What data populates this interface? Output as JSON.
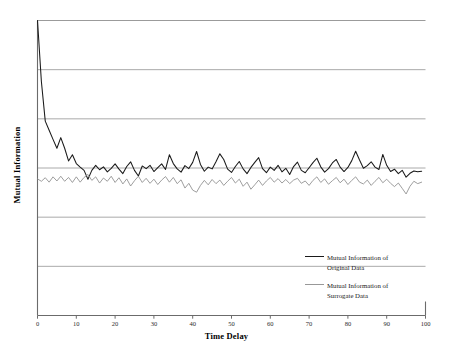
{
  "chart_data": {
    "type": "line",
    "title": "",
    "xlabel": "Time Delay",
    "ylabel": "Mutual Information",
    "xlim": [
      0,
      100
    ],
    "ylim": [
      0,
      1
    ],
    "xticks": [
      "0",
      "10",
      "20",
      "30",
      "40",
      "50",
      "60",
      "70",
      "80",
      "90",
      "100"
    ],
    "yticks": [],
    "grid": "horizontal",
    "gridline_count": 5,
    "legend_position": "inside-lower-right",
    "colors": {
      "original": "#1a1a1a",
      "surrogate": "#8c8c8c",
      "grid": "#8a8a8a",
      "axis": "#6b6b6b"
    },
    "series": [
      {
        "name": "Mutual Information of Original Data",
        "color": "#1a1a1a",
        "x": [
          0,
          1,
          2,
          3,
          4,
          5,
          6,
          7,
          8,
          9,
          10,
          11,
          12,
          13,
          14,
          15,
          16,
          17,
          18,
          19,
          20,
          21,
          22,
          23,
          24,
          25,
          26,
          27,
          28,
          29,
          30,
          31,
          32,
          33,
          34,
          35,
          36,
          37,
          38,
          39,
          40,
          41,
          42,
          43,
          44,
          45,
          46,
          47,
          48,
          49,
          50,
          51,
          52,
          53,
          54,
          55,
          56,
          57,
          58,
          59,
          60,
          61,
          62,
          63,
          64,
          65,
          66,
          67,
          68,
          69,
          70,
          71,
          72,
          73,
          74,
          75,
          76,
          77,
          78,
          79,
          80,
          81,
          82,
          83,
          84,
          85,
          86,
          87,
          88,
          89,
          90,
          91,
          92,
          93,
          94,
          95,
          96,
          97,
          98,
          99
        ],
        "values": [
          1.0,
          0.793,
          0.659,
          0.628,
          0.597,
          0.567,
          0.603,
          0.567,
          0.524,
          0.545,
          0.515,
          0.503,
          0.492,
          0.462,
          0.492,
          0.509,
          0.494,
          0.504,
          0.487,
          0.499,
          0.514,
          0.496,
          0.481,
          0.505,
          0.521,
          0.492,
          0.473,
          0.507,
          0.498,
          0.509,
          0.488,
          0.501,
          0.514,
          0.495,
          0.545,
          0.515,
          0.497,
          0.486,
          0.508,
          0.498,
          0.519,
          0.556,
          0.512,
          0.489,
          0.503,
          0.497,
          0.521,
          0.548,
          0.529,
          0.496,
          0.485,
          0.505,
          0.522,
          0.497,
          0.481,
          0.502,
          0.519,
          0.535,
          0.498,
          0.484,
          0.503,
          0.492,
          0.509,
          0.487,
          0.499,
          0.478,
          0.505,
          0.52,
          0.492,
          0.484,
          0.501,
          0.518,
          0.533,
          0.504,
          0.486,
          0.498,
          0.517,
          0.529,
          0.503,
          0.488,
          0.502,
          0.525,
          0.557,
          0.527,
          0.499,
          0.508,
          0.521,
          0.503,
          0.495,
          0.546,
          0.509,
          0.488,
          0.496,
          0.481,
          0.492,
          0.469,
          0.482,
          0.49,
          0.487,
          0.489
        ]
      },
      {
        "name": "Mutual Information of Surrogate Data",
        "color": "#8c8c8c",
        "x": [
          0,
          1,
          2,
          3,
          4,
          5,
          6,
          7,
          8,
          9,
          10,
          11,
          12,
          13,
          14,
          15,
          16,
          17,
          18,
          19,
          20,
          21,
          22,
          23,
          24,
          25,
          26,
          27,
          28,
          29,
          30,
          31,
          32,
          33,
          34,
          35,
          36,
          37,
          38,
          39,
          40,
          41,
          42,
          43,
          44,
          45,
          46,
          47,
          48,
          49,
          50,
          51,
          52,
          53,
          54,
          55,
          56,
          57,
          58,
          59,
          60,
          61,
          62,
          63,
          64,
          65,
          66,
          67,
          68,
          69,
          70,
          71,
          72,
          73,
          74,
          75,
          76,
          77,
          78,
          79,
          80,
          81,
          82,
          83,
          84,
          85,
          86,
          87,
          88,
          89,
          90,
          91,
          92,
          93,
          94,
          95,
          96,
          97,
          98,
          99
        ],
        "values": [
          0.463,
          0.455,
          0.467,
          0.452,
          0.47,
          0.456,
          0.472,
          0.455,
          0.468,
          0.451,
          0.47,
          0.452,
          0.468,
          0.478,
          0.458,
          0.47,
          0.449,
          0.466,
          0.455,
          0.472,
          0.451,
          0.467,
          0.446,
          0.463,
          0.439,
          0.457,
          0.472,
          0.451,
          0.465,
          0.448,
          0.462,
          0.444,
          0.459,
          0.471,
          0.452,
          0.468,
          0.447,
          0.46,
          0.432,
          0.448,
          0.425,
          0.418,
          0.441,
          0.458,
          0.443,
          0.461,
          0.447,
          0.459,
          0.441,
          0.455,
          0.468,
          0.449,
          0.462,
          0.438,
          0.452,
          0.428,
          0.443,
          0.459,
          0.441,
          0.456,
          0.468,
          0.452,
          0.464,
          0.449,
          0.461,
          0.447,
          0.459,
          0.465,
          0.448,
          0.456,
          0.441,
          0.458,
          0.47,
          0.451,
          0.463,
          0.445,
          0.457,
          0.468,
          0.45,
          0.462,
          0.444,
          0.458,
          0.47,
          0.452,
          0.446,
          0.459,
          0.441,
          0.455,
          0.468,
          0.45,
          0.462,
          0.448,
          0.437,
          0.449,
          0.431,
          0.412,
          0.438,
          0.455,
          0.447,
          0.452
        ]
      }
    ]
  },
  "legend": {
    "entries": [
      {
        "label": "Mutual Information of\nOriginal Data",
        "color": "#1a1a1a"
      },
      {
        "label": "Mutual Information of\nSurrogate Data",
        "color": "#8c8c8c"
      }
    ]
  }
}
